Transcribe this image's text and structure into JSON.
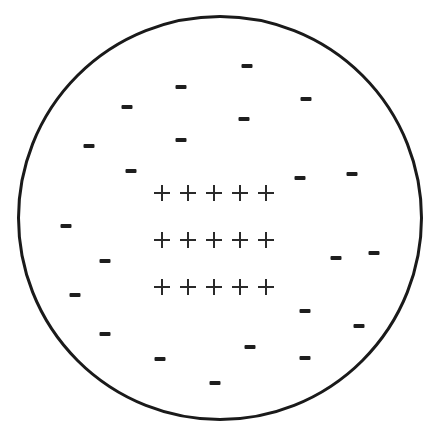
{
  "diagram": {
    "title": "",
    "colors": {
      "background": "#ffffff",
      "stroke": "#1a1a1a",
      "symbol": "#222222"
    },
    "circle": {
      "cx": 220,
      "cy": 218,
      "r": 203
    },
    "positive_symbol": "+",
    "negative_symbol": "-",
    "positive_charges": {
      "rows": 3,
      "cols": 5,
      "xs": [
        162,
        188,
        214,
        240,
        266
      ],
      "ys": [
        193,
        240,
        287
      ]
    },
    "negative_charges": [
      {
        "x": 181,
        "y": 87
      },
      {
        "x": 247,
        "y": 66
      },
      {
        "x": 127,
        "y": 107
      },
      {
        "x": 306,
        "y": 99
      },
      {
        "x": 89,
        "y": 146
      },
      {
        "x": 181,
        "y": 140
      },
      {
        "x": 244,
        "y": 119
      },
      {
        "x": 131,
        "y": 171
      },
      {
        "x": 300,
        "y": 178
      },
      {
        "x": 352,
        "y": 174
      },
      {
        "x": 66,
        "y": 226
      },
      {
        "x": 105,
        "y": 261
      },
      {
        "x": 336,
        "y": 258
      },
      {
        "x": 374,
        "y": 253
      },
      {
        "x": 75,
        "y": 295
      },
      {
        "x": 305,
        "y": 311
      },
      {
        "x": 359,
        "y": 326
      },
      {
        "x": 105,
        "y": 334
      },
      {
        "x": 250,
        "y": 347
      },
      {
        "x": 160,
        "y": 359
      },
      {
        "x": 305,
        "y": 358
      },
      {
        "x": 215,
        "y": 383
      }
    ]
  }
}
